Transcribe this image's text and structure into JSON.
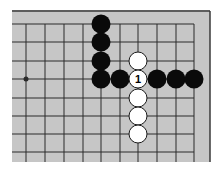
{
  "diagram": {
    "type": "go-board-fragment",
    "board": {
      "background": "#c6c6c6",
      "line_color": "#2a2a2a",
      "border_color": "#3a3a3a",
      "left": 12,
      "top": 11,
      "right": 210,
      "bottom": 162,
      "grid_x": [
        26,
        45,
        64,
        83,
        101,
        120,
        138,
        157,
        176,
        194
      ],
      "grid_y": [
        24,
        42,
        61,
        79,
        98,
        116,
        134,
        152
      ],
      "star_points": [
        [
          0,
          3
        ]
      ]
    },
    "stones": [
      {
        "color": "black",
        "col": 4,
        "row": 0
      },
      {
        "color": "black",
        "col": 4,
        "row": 1
      },
      {
        "color": "black",
        "col": 4,
        "row": 2
      },
      {
        "color": "black",
        "col": 4,
        "row": 3
      },
      {
        "color": "black",
        "col": 5,
        "row": 3
      },
      {
        "color": "white",
        "col": 6,
        "row": 2
      },
      {
        "color": "white",
        "col": 6,
        "row": 3,
        "label": "1"
      },
      {
        "color": "black",
        "col": 7,
        "row": 3
      },
      {
        "color": "black",
        "col": 8,
        "row": 3
      },
      {
        "color": "black",
        "col": 9,
        "row": 3
      },
      {
        "color": "white",
        "col": 6,
        "row": 4
      },
      {
        "color": "white",
        "col": 6,
        "row": 5
      },
      {
        "color": "white",
        "col": 6,
        "row": 6
      }
    ],
    "stone_colors": {
      "black": "#0a0a0a",
      "white": "#ffffff",
      "white_outline": "#1a1a1a"
    },
    "stone_radius": 9.5
  }
}
